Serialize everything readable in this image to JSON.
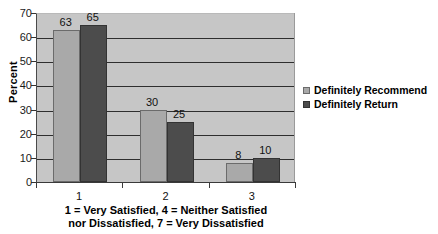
{
  "chart_data": {
    "type": "bar",
    "title": "",
    "subtitle": "",
    "xlabel": "1 = Very Satisfied, 4 = Neither Satisfied nor Dissatisfied, 7 = Very Dissatisfied",
    "xlabel_lines": [
      "1 = Very Satisfied, 4 = Neither Satisfied",
      "nor Dissatisfied, 7 = Very Dissatisfied"
    ],
    "ylabel": "Percent",
    "categories": [
      "1",
      "2",
      "3"
    ],
    "series": [
      {
        "name": "Definitely Recommend",
        "color": "#a9a9a9",
        "values": [
          63,
          30,
          8
        ]
      },
      {
        "name": "Definitely Return",
        "color": "#4c4c4c",
        "values": [
          65,
          25,
          10
        ]
      }
    ],
    "ylim": [
      0,
      70
    ],
    "ytick_step": 10,
    "ytick_labels": [
      "70",
      "60",
      "50",
      "40",
      "30",
      "20",
      "10",
      "0"
    ],
    "grid": true,
    "grid_axis": "y",
    "legend_position": "right",
    "data_labels": true,
    "plot_background": "#c6c6c6",
    "figure_background": "#ffffff"
  }
}
